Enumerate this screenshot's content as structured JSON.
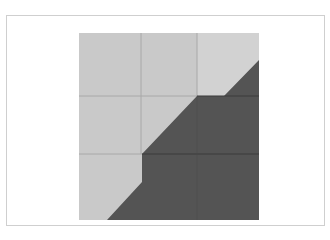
{
  "figure": {
    "colors": {
      "background": "#ffffff",
      "frame_border": "#cfcfcf",
      "light_region": "#c9c9c9",
      "dark_region": "#545454",
      "grid_line_light": "#a8a8a8",
      "grid_line_dark": "#3a3a3a"
    },
    "grid": {
      "rows": 3,
      "cols": 3
    }
  }
}
